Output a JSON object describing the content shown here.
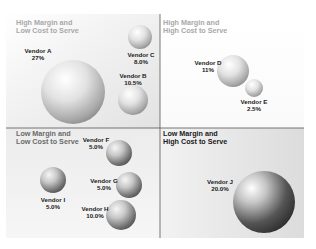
{
  "chart_data": {
    "type": "scatter",
    "subtype": "bubble-quadrant",
    "title": "",
    "xlabel": "Cost to Serve",
    "ylabel": "Margin",
    "grid": false,
    "quadrants": [
      {
        "id": "tl",
        "line1": "High Margin and",
        "line2": "Low Cost to Serve",
        "title_color": "#a8a8a8"
      },
      {
        "id": "tr",
        "line1": "High Margin and",
        "line2": "High Cost to Serve",
        "title_color": "#a8a8a8"
      },
      {
        "id": "bl",
        "line1": "Low Margin and",
        "line2": "Low Cost to Serve",
        "title_color": "#6a6a6a"
      },
      {
        "id": "br",
        "line1": "Low Margin and",
        "line2": "High Cost to Serve",
        "title_color": "#1a1a1a"
      }
    ],
    "points": [
      {
        "name": "Vendor A",
        "value": "27%",
        "share": 27,
        "quadrant": "tl"
      },
      {
        "name": "Vendor B",
        "value": "10.5%",
        "share": 10.5,
        "quadrant": "tl"
      },
      {
        "name": "Vendor C",
        "value": "8.0%",
        "share": 8.0,
        "quadrant": "tl"
      },
      {
        "name": "Vendor D",
        "value": "11%",
        "share": 11,
        "quadrant": "tr"
      },
      {
        "name": "Vendor E",
        "value": "2.5%",
        "share": 2.5,
        "quadrant": "tr"
      },
      {
        "name": "Vendor F",
        "value": "5.0%",
        "share": 5.0,
        "quadrant": "bl"
      },
      {
        "name": "Vendor G",
        "value": "5.0%",
        "share": 5.0,
        "quadrant": "bl"
      },
      {
        "name": "Vendor H",
        "value": "10.0%",
        "share": 10.0,
        "quadrant": "bl"
      },
      {
        "name": "Vendor I",
        "value": "5.0%",
        "share": 5.0,
        "quadrant": "bl"
      },
      {
        "name": "Vendor J",
        "value": "20.0%",
        "share": 20.0,
        "quadrant": "br"
      }
    ]
  }
}
